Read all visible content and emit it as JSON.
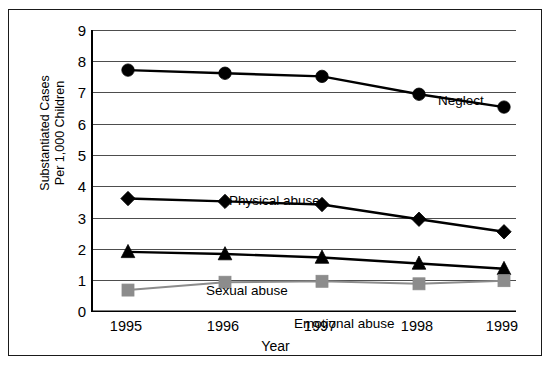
{
  "chart_data": {
    "type": "line",
    "title": "",
    "subtitle": "",
    "xlabel": "Year",
    "ylabel": "Substantiated Cases Per 1,000 Children",
    "ylabel_line1": "Substantiated Cases",
    "ylabel_line2": "Per 1,000 Children",
    "categories": [
      "1995",
      "1996",
      "1997",
      "1998",
      "1999"
    ],
    "x": [
      1995,
      1996,
      1997,
      1998,
      1999
    ],
    "ylim": [
      0,
      9
    ],
    "yticks": [
      9,
      8,
      7,
      6,
      5,
      4,
      3,
      2,
      1,
      0
    ],
    "ytick_labels": [
      "9",
      "8",
      "7",
      "6",
      "5",
      "4",
      "3",
      "2",
      "1",
      "0"
    ],
    "grid": "horizontal",
    "legend_position": "inline-annotations",
    "series": [
      {
        "name": "Neglect",
        "marker": "circle",
        "color": "#000000",
        "values": [
          7.72,
          7.62,
          7.52,
          6.95,
          6.54
        ]
      },
      {
        "name": "Physical abuse",
        "marker": "diamond",
        "color": "#000000",
        "values": [
          3.62,
          3.53,
          3.43,
          2.96,
          2.56
        ]
      },
      {
        "name": "Sexual abuse",
        "marker": "triangle",
        "color": "#000000",
        "values": [
          1.92,
          1.85,
          1.74,
          1.55,
          1.38
        ]
      },
      {
        "name": "Emotional abuse",
        "marker": "square",
        "color": "#8c8c8c",
        "values": [
          0.7,
          0.95,
          0.98,
          0.9,
          1.0
        ]
      }
    ],
    "annotations": [
      {
        "text": "Neglect",
        "series": "Neglect"
      },
      {
        "text": "Physical abuse",
        "series": "Physical abuse"
      },
      {
        "text": "Sexual abuse",
        "series": "Sexual abuse"
      },
      {
        "text": "Emotional abuse",
        "series": "Emotional abuse"
      }
    ]
  },
  "colors": {
    "axis": "#000000",
    "grid": "#4d4d4d",
    "frame": "#1a1a1a",
    "background": "#ffffff",
    "series_dark": "#000000",
    "series_gray": "#8c8c8c"
  }
}
